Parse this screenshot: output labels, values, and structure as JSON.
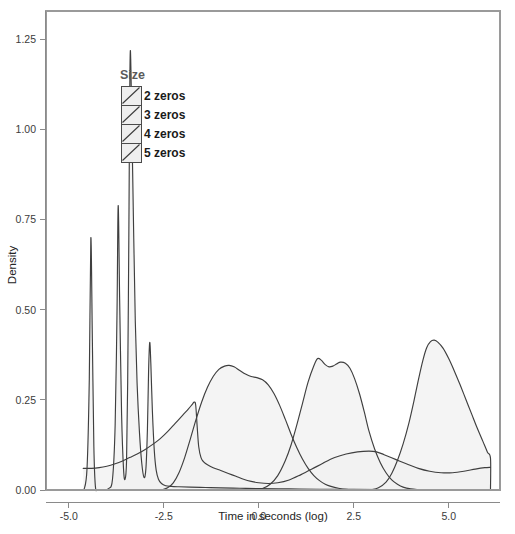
{
  "chart_data": {
    "type": "area",
    "title": "",
    "xlabel": "Time in seconds (log)",
    "ylabel": "Density",
    "xlim": [
      -5.6,
      6.35
    ],
    "ylim": [
      0.0,
      1.33
    ],
    "xticks": [
      -5.0,
      -2.5,
      0.0,
      2.5,
      5.0
    ],
    "xtick_labels": [
      "-5.0",
      "-2.5",
      "0.0",
      "2.5",
      "5.0"
    ],
    "yticks": [
      0.0,
      0.25,
      0.5,
      0.75,
      1.0,
      1.25
    ],
    "ytick_labels": [
      "0.00",
      "0.25",
      "0.50",
      "0.75",
      "1.00",
      "1.25"
    ],
    "grid": false,
    "legend": {
      "title": "Size",
      "position": "inside-upper-left",
      "entries": [
        "2 zeros",
        "3 zeros",
        "4 zeros",
        "5 zeros"
      ]
    },
    "fill_color": "#f1f1f1",
    "line_color": "#3f3f3f",
    "series": [
      {
        "name": "2 zeros",
        "points": [
          [
            -4.6,
            0.0
          ],
          [
            -4.52,
            0.06
          ],
          [
            -4.46,
            0.31
          ],
          [
            -4.42,
            0.7
          ],
          [
            -4.38,
            0.42
          ],
          [
            -4.34,
            0.12
          ],
          [
            -4.3,
            0.01
          ],
          [
            -4.24,
            0.0
          ],
          [
            -4.1,
            0.0
          ],
          [
            -3.95,
            0.004
          ],
          [
            -3.85,
            0.03
          ],
          [
            -3.78,
            0.18
          ],
          [
            -3.73,
            0.5
          ],
          [
            -3.7,
            0.79
          ],
          [
            -3.66,
            0.52
          ],
          [
            -3.61,
            0.21
          ],
          [
            -3.56,
            0.06
          ],
          [
            -3.52,
            0.03
          ],
          [
            -3.48,
            0.08
          ],
          [
            -3.45,
            0.3
          ],
          [
            -3.42,
            0.7
          ],
          [
            -3.4,
            1.05
          ],
          [
            -3.38,
            1.22
          ],
          [
            -3.35,
            1.08
          ],
          [
            -3.3,
            0.76
          ],
          [
            -3.25,
            0.47
          ],
          [
            -3.2,
            0.29
          ],
          [
            -3.14,
            0.16
          ],
          [
            -3.08,
            0.075
          ],
          [
            -3.02,
            0.035
          ],
          [
            -2.97,
            0.06
          ],
          [
            -2.93,
            0.17
          ],
          [
            -2.9,
            0.33
          ],
          [
            -2.87,
            0.41
          ],
          [
            -2.84,
            0.35
          ],
          [
            -2.8,
            0.22
          ],
          [
            -2.75,
            0.11
          ],
          [
            -2.7,
            0.055
          ],
          [
            -2.64,
            0.03
          ],
          [
            -2.56,
            0.018
          ],
          [
            -2.45,
            0.012
          ],
          [
            -2.3,
            0.01
          ],
          [
            -2.1,
            0.009
          ],
          [
            -1.8,
            0.008
          ],
          [
            -1.4,
            0.007
          ],
          [
            -1.0,
            0.006
          ],
          [
            -0.5,
            0.005
          ],
          [
            0.0,
            0.004
          ],
          [
            0.8,
            0.003
          ],
          [
            1.6,
            0.002
          ],
          [
            2.5,
            0.002
          ],
          [
            3.5,
            0.001
          ],
          [
            4.5,
            0.001
          ],
          [
            5.5,
            0.001
          ],
          [
            6.1,
            0.001
          ]
        ],
        "peaks": [
          {
            "x": -4.42,
            "y": 0.7
          },
          {
            "x": -3.7,
            "y": 0.79
          },
          {
            "x": -3.38,
            "y": 1.22
          },
          {
            "x": -2.87,
            "y": 0.41
          }
        ]
      },
      {
        "name": "3 zeros",
        "points": [
          [
            -4.62,
            0.06
          ],
          [
            -4.4,
            0.06
          ],
          [
            -4.2,
            0.062
          ],
          [
            -4.0,
            0.066
          ],
          [
            -3.8,
            0.072
          ],
          [
            -3.6,
            0.08
          ],
          [
            -3.4,
            0.09
          ],
          [
            -3.2,
            0.1
          ],
          [
            -3.0,
            0.112
          ],
          [
            -2.8,
            0.126
          ],
          [
            -2.6,
            0.142
          ],
          [
            -2.4,
            0.162
          ],
          [
            -2.2,
            0.185
          ],
          [
            -2.0,
            0.208
          ],
          [
            -1.85,
            0.225
          ],
          [
            -1.75,
            0.238
          ],
          [
            -1.7,
            0.244
          ],
          [
            -1.66,
            0.236
          ],
          [
            -1.62,
            0.175
          ],
          [
            -1.58,
            0.12
          ],
          [
            -1.52,
            0.09
          ],
          [
            -1.45,
            0.078
          ],
          [
            -1.35,
            0.07
          ],
          [
            -1.2,
            0.062
          ],
          [
            -1.0,
            0.054
          ],
          [
            -0.8,
            0.046
          ],
          [
            -0.6,
            0.038
          ],
          [
            -0.4,
            0.03
          ],
          [
            -0.2,
            0.024
          ],
          [
            0.0,
            0.02
          ],
          [
            0.25,
            0.018
          ],
          [
            0.5,
            0.02
          ],
          [
            0.8,
            0.028
          ],
          [
            1.1,
            0.042
          ],
          [
            1.4,
            0.058
          ],
          [
            1.7,
            0.075
          ],
          [
            2.0,
            0.09
          ],
          [
            2.3,
            0.1
          ],
          [
            2.6,
            0.106
          ],
          [
            2.9,
            0.108
          ],
          [
            3.1,
            0.106
          ],
          [
            3.3,
            0.098
          ],
          [
            3.6,
            0.085
          ],
          [
            3.9,
            0.072
          ],
          [
            4.2,
            0.06
          ],
          [
            4.5,
            0.052
          ],
          [
            4.8,
            0.048
          ],
          [
            5.1,
            0.048
          ],
          [
            5.4,
            0.052
          ],
          [
            5.7,
            0.058
          ],
          [
            5.95,
            0.062
          ],
          [
            6.1,
            0.063
          ]
        ],
        "peaks": [
          {
            "x": -1.7,
            "y": 0.244
          },
          {
            "x": 2.9,
            "y": 0.108
          }
        ]
      },
      {
        "name": "4 zeros",
        "points": [
          [
            -2.55,
            0.0
          ],
          [
            -2.4,
            0.006
          ],
          [
            -2.25,
            0.02
          ],
          [
            -2.1,
            0.048
          ],
          [
            -1.95,
            0.09
          ],
          [
            -1.8,
            0.142
          ],
          [
            -1.65,
            0.196
          ],
          [
            -1.5,
            0.245
          ],
          [
            -1.35,
            0.285
          ],
          [
            -1.2,
            0.315
          ],
          [
            -1.05,
            0.335
          ],
          [
            -0.9,
            0.344
          ],
          [
            -0.78,
            0.346
          ],
          [
            -0.65,
            0.342
          ],
          [
            -0.5,
            0.332
          ],
          [
            -0.35,
            0.322
          ],
          [
            -0.2,
            0.315
          ],
          [
            -0.05,
            0.312
          ],
          [
            0.1,
            0.306
          ],
          [
            0.25,
            0.292
          ],
          [
            0.4,
            0.268
          ],
          [
            0.55,
            0.235
          ],
          [
            0.7,
            0.196
          ],
          [
            0.85,
            0.155
          ],
          [
            1.0,
            0.118
          ],
          [
            1.15,
            0.086
          ],
          [
            1.3,
            0.06
          ],
          [
            1.45,
            0.04
          ],
          [
            1.6,
            0.026
          ],
          [
            1.75,
            0.016
          ],
          [
            1.9,
            0.01
          ],
          [
            2.1,
            0.005
          ],
          [
            2.3,
            0.002
          ],
          [
            2.55,
            0.001
          ],
          [
            2.8,
            0.0
          ],
          [
            3.2,
            0.0
          ]
        ],
        "peaks": [
          {
            "x": -0.78,
            "y": 0.346
          }
        ]
      },
      {
        "name": "5 zeros",
        "points": [
          [
            -0.1,
            0.0
          ],
          [
            0.1,
            0.004
          ],
          [
            0.3,
            0.016
          ],
          [
            0.5,
            0.04
          ],
          [
            0.7,
            0.082
          ],
          [
            0.85,
            0.125
          ],
          [
            1.0,
            0.18
          ],
          [
            1.15,
            0.24
          ],
          [
            1.3,
            0.3
          ],
          [
            1.45,
            0.345
          ],
          [
            1.55,
            0.365
          ],
          [
            1.65,
            0.36
          ],
          [
            1.75,
            0.348
          ],
          [
            1.85,
            0.342
          ],
          [
            1.95,
            0.344
          ],
          [
            2.05,
            0.35
          ],
          [
            2.15,
            0.355
          ],
          [
            2.28,
            0.352
          ],
          [
            2.4,
            0.338
          ],
          [
            2.52,
            0.31
          ],
          [
            2.65,
            0.268
          ],
          [
            2.78,
            0.216
          ],
          [
            2.9,
            0.164
          ],
          [
            3.05,
            0.114
          ],
          [
            3.2,
            0.076
          ],
          [
            3.35,
            0.048
          ],
          [
            3.5,
            0.028
          ],
          [
            3.65,
            0.016
          ],
          [
            3.8,
            0.008
          ],
          [
            4.0,
            0.003
          ],
          [
            4.2,
            0.001
          ],
          [
            4.4,
            0.0
          ]
        ],
        "peaks": [
          {
            "x": 1.55,
            "y": 0.365
          },
          {
            "x": 2.15,
            "y": 0.355
          }
        ]
      },
      {
        "name": "5 zeros (upper)",
        "points": [
          [
            2.95,
            0.0
          ],
          [
            3.15,
            0.006
          ],
          [
            3.35,
            0.022
          ],
          [
            3.5,
            0.046
          ],
          [
            3.65,
            0.082
          ],
          [
            3.8,
            0.128
          ],
          [
            3.95,
            0.185
          ],
          [
            4.08,
            0.245
          ],
          [
            4.2,
            0.305
          ],
          [
            4.32,
            0.36
          ],
          [
            4.42,
            0.395
          ],
          [
            4.52,
            0.412
          ],
          [
            4.62,
            0.416
          ],
          [
            4.72,
            0.41
          ],
          [
            4.85,
            0.394
          ],
          [
            5.0,
            0.365
          ],
          [
            5.15,
            0.33
          ],
          [
            5.3,
            0.292
          ],
          [
            5.45,
            0.252
          ],
          [
            5.6,
            0.212
          ],
          [
            5.75,
            0.172
          ],
          [
            5.9,
            0.135
          ],
          [
            6.02,
            0.105
          ],
          [
            6.1,
            0.088
          ],
          [
            6.1,
            0.0
          ]
        ],
        "peaks": [
          {
            "x": 4.62,
            "y": 0.416
          }
        ]
      }
    ]
  },
  "axes": {
    "x_title": "Time in seconds (log)",
    "y_title": "Density"
  }
}
